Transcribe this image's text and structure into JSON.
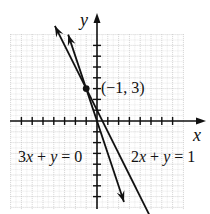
{
  "chart_data": {
    "type": "line",
    "title": "",
    "xlabel": "x",
    "ylabel": "y",
    "xlim": [
      -8,
      8
    ],
    "ylim": [
      -8,
      8
    ],
    "grid": true,
    "series": [
      {
        "name": "3x + y = 0",
        "equation": "y = -3x",
        "slope": -3,
        "intercept": 0,
        "x": [
          -2.67,
          2.5
        ],
        "y": [
          8,
          -7.5
        ]
      },
      {
        "name": "2x + y = 1",
        "equation": "y = 1 - 2x",
        "slope": -2,
        "intercept": 1,
        "x": [
          -3.9,
          5.4
        ],
        "y": [
          8.8,
          -9.8
        ]
      }
    ],
    "annotations": [
      {
        "text": "(−1, 3)",
        "x": -1,
        "y": 3,
        "marker": "point"
      }
    ]
  },
  "labels": {
    "x_axis": "x",
    "y_axis": "y",
    "point": "(−1, 3)",
    "line1_a": "3",
    "line1_b": "x",
    "line1_c": " + ",
    "line1_d": "y",
    "line1_e": " = 0",
    "line2_a": "2",
    "line2_b": "x",
    "line2_c": " + ",
    "line2_d": "y",
    "line2_e": " = 1"
  }
}
